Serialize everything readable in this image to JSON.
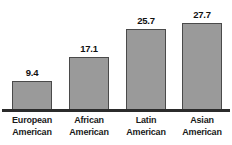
{
  "title_remnant": "",
  "chart_data": {
    "type": "bar",
    "title": "",
    "subtitle": "",
    "xlabel": "",
    "ylabel": "",
    "categories": [
      "European\nAmerican",
      "African\nAmerican",
      "Latin\nAmerican",
      "Asian\nAmerican"
    ],
    "category_lines": [
      [
        "European",
        "American"
      ],
      [
        "African",
        "American"
      ],
      [
        "Latin",
        "American"
      ],
      [
        "Asian",
        "American"
      ]
    ],
    "values": [
      9.4,
      17.1,
      25.7,
      27.7
    ],
    "value_labels": [
      "9.4",
      "17.1",
      "25.7",
      "27.7"
    ],
    "ylim": [
      0,
      30
    ],
    "grid": false,
    "legend": false,
    "legend_position": "none",
    "bar_color": "#9a9a9a",
    "bar_border_color": "#4a4a4a",
    "axis_color": "#2b2b2b",
    "label_color": "#1a1a1a"
  }
}
